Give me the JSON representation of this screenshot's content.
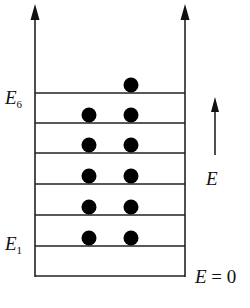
{
  "diagram": {
    "title": "",
    "labels": {
      "top_level": {
        "base": "E",
        "sub": "6"
      },
      "bottom_level": {
        "base": "E",
        "sub": "1"
      },
      "energy_arrow": "E",
      "zero": {
        "base": "E",
        "rest": " = 0"
      }
    },
    "levels": [
      {
        "name": "E6",
        "y": 93,
        "electrons": 1
      },
      {
        "name": "E5",
        "y": 123,
        "electrons": 2
      },
      {
        "name": "E4",
        "y": 153,
        "electrons": 2
      },
      {
        "name": "E3",
        "y": 184,
        "electrons": 2
      },
      {
        "name": "E2",
        "y": 215,
        "electrons": 2
      },
      {
        "name": "E1",
        "y": 246,
        "electrons": 2
      }
    ],
    "ground_line_y": 276,
    "colors": {
      "line": "#222222",
      "electron": "#000000",
      "background": "#ffffff"
    }
  }
}
